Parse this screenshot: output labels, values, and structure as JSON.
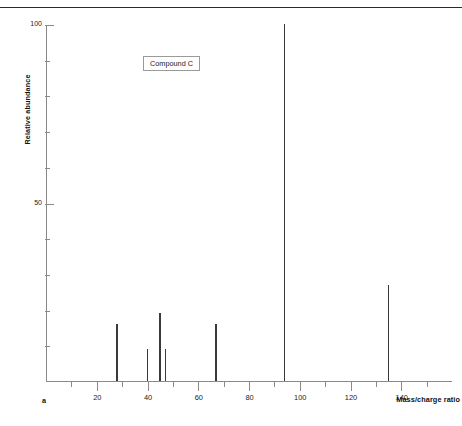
{
  "figure": {
    "panel_letter": "a",
    "annotation_label": "Compound C",
    "axis_color": "#8a8a8a",
    "peak_color": "#3a3a3a"
  },
  "chart_data": {
    "type": "bar",
    "title": "",
    "subtitle": "",
    "annotation": "Compound C",
    "xlabel": "Mass/charge ratio",
    "ylabel": "Relative abundance",
    "xlim": [
      0,
      160
    ],
    "ylim": [
      0,
      100
    ],
    "grid": false,
    "legend": false,
    "x_major_ticks": [
      20,
      40,
      60,
      80,
      100,
      120,
      140
    ],
    "x_major_tick_labels": [
      "20",
      "40",
      "60",
      "80",
      "100",
      "120",
      "140"
    ],
    "x_minor_ticks": [
      10,
      30,
      50,
      70,
      90,
      110,
      130,
      150
    ],
    "y_major_ticks": [
      50,
      100
    ],
    "y_major_tick_labels": [
      "50",
      "100"
    ],
    "y_minor_ticks": [
      10,
      20,
      30,
      40,
      60,
      70,
      80,
      90
    ],
    "x": [
      28,
      40,
      45,
      47,
      67,
      94,
      135
    ],
    "values": [
      16,
      9,
      19,
      9,
      16,
      100,
      27
    ],
    "peaks": [
      {
        "mz": 28,
        "abundance": 16
      },
      {
        "mz": 40,
        "abundance": 9
      },
      {
        "mz": 45,
        "abundance": 19
      },
      {
        "mz": 47,
        "abundance": 9
      },
      {
        "mz": 67,
        "abundance": 16
      },
      {
        "mz": 94,
        "abundance": 100
      },
      {
        "mz": 135,
        "abundance": 27
      }
    ]
  }
}
